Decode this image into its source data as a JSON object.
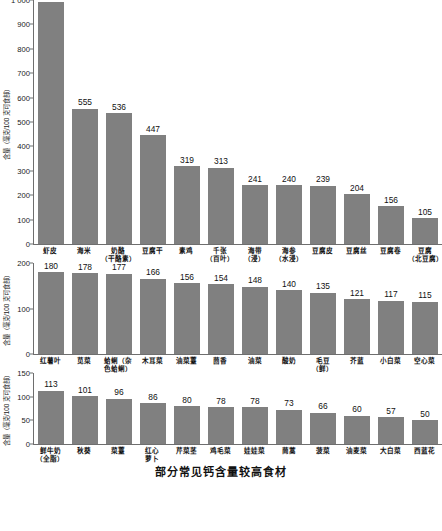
{
  "caption": "部分常见钙含量较高食材",
  "axis": {
    "ylabel": "含量（毫克/100 克可食部）"
  },
  "colors": {
    "bar": "#808080",
    "axis": "#6e6e6e",
    "text": "#111111"
  },
  "chart_data": [
    {
      "type": "bar",
      "title": "部分常见钙含量较高食材",
      "xlabel": "",
      "ylabel": "含量（毫克/100 克可食部）",
      "ylim": [
        0,
        1000
      ],
      "yticks": [
        "0",
        "100",
        "200",
        "300",
        "400",
        "500",
        "600",
        "700",
        "800",
        "900",
        "1 000"
      ],
      "grid": false,
      "legend": "none",
      "categories": [
        "虾皮",
        "海米",
        "奶酪（干酪素）",
        "豆腐干",
        "素鸡",
        "千张（百叶）",
        "海带（浸）",
        "海参（水浸）",
        "豆腐皮",
        "豆腐丝",
        "豆腐卷",
        "豆腐（北豆腐）"
      ],
      "category_lines": [
        [
          "虾皮"
        ],
        [
          "海米"
        ],
        [
          "奶酪",
          "（干酪素）"
        ],
        [
          "豆腐干"
        ],
        [
          "素鸡"
        ],
        [
          "千张",
          "（百叶）"
        ],
        [
          "海带",
          "（浸）"
        ],
        [
          "海参",
          "（水浸）"
        ],
        [
          "豆腐皮"
        ],
        [
          "豆腐丝"
        ],
        [
          "豆腐卷"
        ],
        [
          "豆腐",
          "（北豆腐）"
        ]
      ],
      "values": [
        991,
        555,
        536,
        447,
        319,
        313,
        241,
        240,
        239,
        204,
        156,
        105
      ]
    },
    {
      "type": "bar",
      "title": "",
      "xlabel": "",
      "ylabel": "含量（毫克/100 克可食部）",
      "ylim": [
        0,
        200
      ],
      "yticks": [
        "0",
        "100",
        "200"
      ],
      "grid": false,
      "legend": "none",
      "categories": [
        "红薯叶",
        "苋菜",
        "蛤蜊（杂色蛤蜊）",
        "木耳菜",
        "油菜薹",
        "茴香",
        "油菜",
        "酸奶",
        "毛豆（鲜）",
        "芥蓝",
        "小白菜",
        "空心菜"
      ],
      "category_lines": [
        [
          "红薯叶"
        ],
        [
          "苋菜"
        ],
        [
          "蛤蜊（杂",
          "色蛤蜊）"
        ],
        [
          "木耳菜"
        ],
        [
          "油菜薹"
        ],
        [
          "茴香"
        ],
        [
          "油菜"
        ],
        [
          "酸奶"
        ],
        [
          "毛豆",
          "（鲜）"
        ],
        [
          "芥蓝"
        ],
        [
          "小白菜"
        ],
        [
          "空心菜"
        ]
      ],
      "values": [
        180,
        178,
        177,
        166,
        156,
        154,
        148,
        140,
        135,
        121,
        117,
        115
      ]
    },
    {
      "type": "bar",
      "title": "",
      "xlabel": "",
      "ylabel": "含量（毫克/100 克可食部）",
      "ylim": [
        0,
        150
      ],
      "yticks": [
        "0",
        "50",
        "100",
        "150"
      ],
      "grid": false,
      "legend": "none",
      "categories": [
        "鲜牛奶（全脂）",
        "秋葵",
        "菜薹",
        "红心萝卜",
        "芹菜茎",
        "鸡毛菜",
        "娃娃菜",
        "茼蒿",
        "菠菜",
        "油麦菜",
        "大白菜",
        "西蓝花"
      ],
      "category_lines": [
        [
          "鲜牛奶",
          "（全脂）"
        ],
        [
          "秋葵"
        ],
        [
          "菜薹"
        ],
        [
          "红心",
          "萝卜"
        ],
        [
          "芹菜茎"
        ],
        [
          "鸡毛菜"
        ],
        [
          "娃娃菜"
        ],
        [
          "茼蒿"
        ],
        [
          "菠菜"
        ],
        [
          "油麦菜"
        ],
        [
          "大白菜"
        ],
        [
          "西蓝花"
        ]
      ],
      "values": [
        113,
        101,
        96,
        86,
        80,
        78,
        78,
        73,
        66,
        60,
        57,
        50
      ]
    }
  ]
}
